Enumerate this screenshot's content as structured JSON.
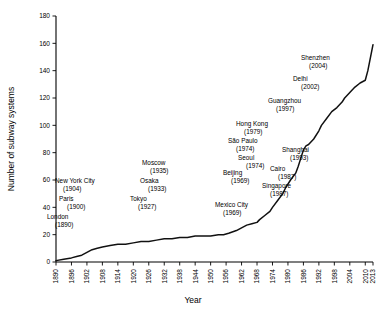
{
  "chart_data": {
    "type": "line",
    "title": "",
    "xlabel": "Year",
    "ylabel": "Number of subway systems",
    "xlim": [
      1890,
      2013
    ],
    "ylim": [
      0,
      180
    ],
    "grid": false,
    "legend": "none",
    "ytick_labels": [
      "0",
      "20",
      "40",
      "60",
      "80",
      "100",
      "120",
      "140",
      "160",
      "180"
    ],
    "ytick_values": [
      0,
      20,
      40,
      60,
      80,
      100,
      120,
      140,
      160,
      180
    ],
    "xtick_labels": [
      "1890",
      "1896",
      "1902",
      "1908",
      "1914",
      "1920",
      "1926",
      "1932",
      "1938",
      "1944",
      "1950",
      "1956",
      "1962",
      "1968",
      "1974",
      "1980",
      "1986",
      "1992",
      "1998",
      "2004",
      "2010",
      "2013"
    ],
    "xtick_values": [
      1890,
      1896,
      1902,
      1908,
      1914,
      1920,
      1926,
      1932,
      1938,
      1944,
      1950,
      1956,
      1962,
      1968,
      1974,
      1980,
      1986,
      1992,
      1998,
      2004,
      2010,
      2013
    ],
    "series": [
      {
        "name": "Cumulative subway systems",
        "x": [
          1890,
          1893,
          1896,
          1898,
          1900,
          1902,
          1904,
          1906,
          1908,
          1911,
          1914,
          1917,
          1920,
          1923,
          1926,
          1929,
          1932,
          1935,
          1938,
          1941,
          1944,
          1947,
          1950,
          1953,
          1955,
          1957,
          1960,
          1962,
          1964,
          1966,
          1968,
          1969,
          1971,
          1973,
          1974,
          1976,
          1978,
          1979,
          1981,
          1983,
          1984,
          1985,
          1986,
          1987,
          1988,
          1990,
          1992,
          1993,
          1995,
          1997,
          1999,
          2001,
          2002,
          2004,
          2006,
          2008,
          2010,
          2011,
          2013
        ],
        "y": [
          1,
          2,
          3,
          4,
          5,
          7,
          9,
          10,
          11,
          12,
          13,
          13,
          14,
          15,
          15,
          16,
          17,
          17,
          18,
          18,
          19,
          19,
          19,
          20,
          20,
          21,
          23,
          25,
          27,
          28,
          29,
          31,
          34,
          37,
          40,
          45,
          50,
          54,
          60,
          65,
          70,
          76,
          82,
          85,
          86,
          90,
          96,
          100,
          105,
          110,
          113,
          117,
          120,
          124,
          128,
          131,
          133,
          140,
          159
        ]
      }
    ],
    "annotations": [
      {
        "city": "London",
        "year": "(1890)",
        "x": 47,
        "y": 219,
        "align": "left"
      },
      {
        "city": "Paris",
        "year": "(1900)",
        "x": 59,
        "y": 201,
        "align": "left"
      },
      {
        "city": "New York City",
        "year": "(1904)",
        "x": 55,
        "y": 183,
        "align": "left"
      },
      {
        "city": "Tokyo",
        "year": "(1927)",
        "x": 130,
        "y": 201,
        "align": "left"
      },
      {
        "city": "Osaka",
        "year": "(1933)",
        "x": 140,
        "y": 183,
        "align": "left"
      },
      {
        "city": "Moscow",
        "year": "(1935)",
        "x": 142,
        "y": 165,
        "align": "left"
      },
      {
        "city": "Mexico City",
        "year": "(1969)",
        "x": 215,
        "y": 207,
        "align": "left"
      },
      {
        "city": "Beijing",
        "year": "(1969)",
        "x": 223,
        "y": 175,
        "align": "left"
      },
      {
        "city": "Seoul",
        "year": "(1974)",
        "x": 238,
        "y": 160,
        "align": "left"
      },
      {
        "city": "São Paulo",
        "year": "(1974)",
        "x": 228,
        "y": 143,
        "align": "left"
      },
      {
        "city": "Hong Kong",
        "year": "(1979)",
        "x": 236,
        "y": 126,
        "align": "left"
      },
      {
        "city": "Singapore",
        "year": "(1987)",
        "x": 262,
        "y": 188,
        "align": "left"
      },
      {
        "city": "Cairo",
        "year": "(1987)",
        "x": 270,
        "y": 171,
        "align": "left"
      },
      {
        "city": "Shanghai",
        "year": "(1993)",
        "x": 282,
        "y": 152,
        "align": "left"
      },
      {
        "city": "Guangzhou",
        "year": "(1997)",
        "x": 268,
        "y": 103,
        "align": "left"
      },
      {
        "city": "Delhi",
        "year": "(2002)",
        "x": 293,
        "y": 81,
        "align": "left"
      },
      {
        "city": "Shenzhen",
        "year": "(2004)",
        "x": 301,
        "y": 60,
        "align": "left"
      }
    ]
  },
  "colors": {
    "background": "#ffffff",
    "line": "#111111",
    "axis": "#000000",
    "text": "#000000"
  }
}
